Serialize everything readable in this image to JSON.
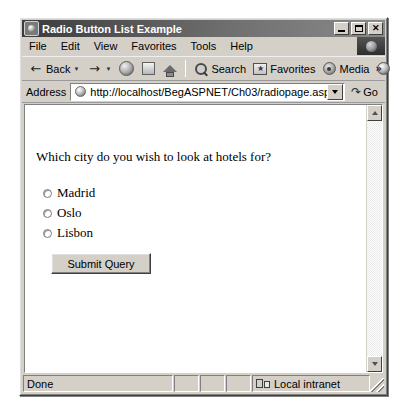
{
  "window": {
    "title": "Radio Button List Example",
    "icon": "ie-globe-icon",
    "controls": {
      "minimize": "Minimize",
      "maximize": "Maximize",
      "close": "Close"
    }
  },
  "menubar": {
    "items": [
      {
        "label": "File"
      },
      {
        "label": "Edit"
      },
      {
        "label": "View"
      },
      {
        "label": "Favorites"
      },
      {
        "label": "Tools"
      },
      {
        "label": "Help"
      }
    ]
  },
  "toolbar": {
    "back_label": "Back",
    "back_icon": "arrow-left-icon",
    "forward_icon": "arrow-right-icon",
    "dropdown_glyph": "▼",
    "stop_icon": "stop-icon",
    "refresh_icon": "refresh-icon",
    "home_icon": "home-icon",
    "search_label": "Search",
    "search_icon": "search-icon",
    "favorites_label": "Favorites",
    "favorites_icon": "favorites-star-icon",
    "media_label": "Media",
    "media_icon": "media-icon",
    "history_icon": "history-icon",
    "overflow_glyph": "»"
  },
  "addressbar": {
    "label": "Address",
    "icon": "page-globe-icon",
    "url": "http://localhost/BegASPNET/Ch03/radiopage.aspx",
    "placeholder": "http://",
    "dropdown_icon": "chevron-down-icon",
    "go_label": "Go",
    "go_icon": "go-arrow-icon",
    "go_glyph": "↷"
  },
  "page": {
    "question": "Which city do you wish to look at hotels for?",
    "radios": [
      {
        "label": "Madrid",
        "checked": false
      },
      {
        "label": "Oslo",
        "checked": false
      },
      {
        "label": "Lisbon",
        "checked": false
      }
    ],
    "submit_label": "Submit Query"
  },
  "scrollbar": {
    "up_icon": "scroll-up-arrow-icon",
    "down_icon": "scroll-down-arrow-icon"
  },
  "statusbar": {
    "status": "Done",
    "panel2": "",
    "panel3": "",
    "panel4": "",
    "zone": "Local intranet",
    "zone_icon": "local-intranet-icon"
  },
  "colors": {
    "chrome": "#d4d0c8",
    "titlebar_dark": "#3b3b3b",
    "page_bg": "#ffffff",
    "text": "#000000"
  }
}
